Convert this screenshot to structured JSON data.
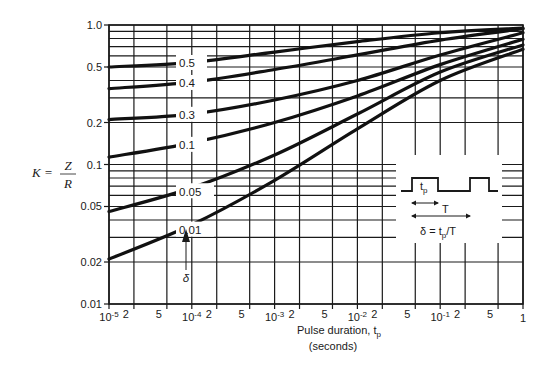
{
  "chart_data": {
    "type": "line",
    "title": "",
    "xlabel": "Pulse duration, t_p (seconds)",
    "xlabel_line1": "Pulse duration, t",
    "xlabel_sub": "p",
    "xlabel_line2": "(seconds)",
    "ylabel": "K = Z / R",
    "xscale": "log",
    "yscale": "log",
    "xlim": [
      1e-05,
      1
    ],
    "ylim": [
      0.01,
      1.0
    ],
    "grid": true,
    "x_ticks": [
      {
        "value": 1e-05,
        "label": "10",
        "exp": "-5"
      },
      {
        "value": 2e-05,
        "label": "2"
      },
      {
        "value": 5e-05,
        "label": "5"
      },
      {
        "value": 0.0001,
        "label": "10",
        "exp": "-4"
      },
      {
        "value": 0.0002,
        "label": "2"
      },
      {
        "value": 0.0005,
        "label": "5"
      },
      {
        "value": 0.001,
        "label": "10",
        "exp": "-3"
      },
      {
        "value": 0.002,
        "label": "2"
      },
      {
        "value": 0.005,
        "label": "5"
      },
      {
        "value": 0.01,
        "label": "10",
        "exp": "-2"
      },
      {
        "value": 0.02,
        "label": "2"
      },
      {
        "value": 0.05,
        "label": "5"
      },
      {
        "value": 0.1,
        "label": "10",
        "exp": "-1"
      },
      {
        "value": 0.2,
        "label": "2"
      },
      {
        "value": 0.5,
        "label": "5"
      },
      {
        "value": 1,
        "label": "1"
      }
    ],
    "y_ticks": [
      {
        "value": 1.0,
        "label": "1.0"
      },
      {
        "value": 0.5,
        "label": "0.5"
      },
      {
        "value": 0.2,
        "label": "0.2"
      },
      {
        "value": 0.1,
        "label": "0.1"
      },
      {
        "value": 0.05,
        "label": "0.05"
      },
      {
        "value": 0.02,
        "label": "0.02"
      },
      {
        "value": 0.01,
        "label": "0.01"
      }
    ],
    "y_gridlines": [
      1.0,
      0.9,
      0.8,
      0.7,
      0.6,
      0.5,
      0.4,
      0.3,
      0.2,
      0.1,
      0.09,
      0.08,
      0.07,
      0.06,
      0.05,
      0.04,
      0.03,
      0.02,
      0.01
    ],
    "x": [
      1e-05,
      0.0001,
      0.001,
      0.01,
      0.1,
      1
    ],
    "series": [
      {
        "name": "δ = 0.5",
        "label": "0.5",
        "values": [
          0.5,
          0.54,
          0.64,
          0.76,
          0.88,
          0.95
        ]
      },
      {
        "name": "δ = 0.4",
        "label": "0.4",
        "values": [
          0.35,
          0.39,
          0.48,
          0.61,
          0.78,
          0.94
        ]
      },
      {
        "name": "δ = 0.3",
        "label": "0.3",
        "values": [
          0.21,
          0.23,
          0.29,
          0.4,
          0.61,
          0.88
        ]
      },
      {
        "name": "δ = 0.1",
        "label": "0.1",
        "values": [
          0.113,
          0.143,
          0.2,
          0.31,
          0.52,
          0.79
        ]
      },
      {
        "name": "δ = 0.05",
        "label": "0.05",
        "values": [
          0.046,
          0.068,
          0.117,
          0.23,
          0.46,
          0.72
        ]
      },
      {
        "name": "δ = 0.01",
        "label": "0.01",
        "values": [
          0.021,
          0.037,
          0.077,
          0.18,
          0.4,
          0.67
        ]
      }
    ],
    "annotations": {
      "delta_arrow_label": "δ",
      "inset": {
        "tp_label": "t",
        "tp_sub": "p",
        "period_label": "T",
        "formula_prefix": "δ = t",
        "formula_sub": "p",
        "formula_suffix": "/T"
      }
    }
  },
  "labels": {
    "ylabel_K": "K =",
    "ylabel_Z": "Z",
    "ylabel_R": "R"
  }
}
